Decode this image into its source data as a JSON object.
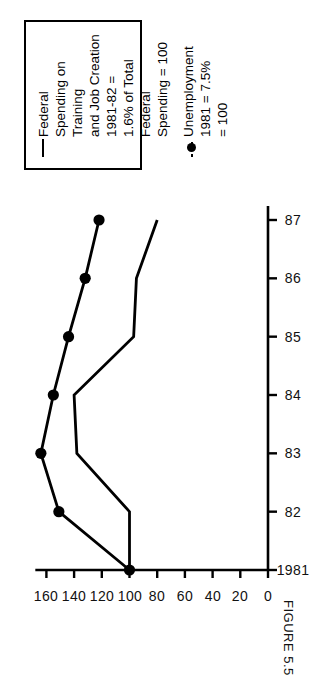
{
  "figure": {
    "caption": "FIGURE 5.5"
  },
  "legend": {
    "entries": [
      {
        "key": "solid-line",
        "label": "Federal Spending on Training\nand Job Creation  1981-82 =\n1.6% of Total Federal\nSpending = 100"
      },
      {
        "key": "dot-marker-line",
        "label": "Unemployment 1981 = 7.5%\n= 100"
      }
    ]
  },
  "chart_data": {
    "type": "line",
    "title": "",
    "subtitle": "",
    "xlabel": "",
    "ylabel": "",
    "x": [
      "1981",
      "82",
      "83",
      "84",
      "85",
      "86",
      "87"
    ],
    "xtick_labels": [
      "1981",
      "82",
      "83",
      "84",
      "85",
      "86",
      "87"
    ],
    "ytick_labels": [
      "0",
      "20",
      "40",
      "60",
      "80",
      "100",
      "120",
      "140",
      "160"
    ],
    "ytick_values": [
      0,
      20,
      40,
      60,
      80,
      100,
      120,
      140,
      160
    ],
    "ylim": [
      0,
      172
    ],
    "grid": false,
    "legend_position": "right",
    "series": [
      {
        "name": "Federal Spending on Training and Job Creation",
        "style": "solid",
        "markers": false,
        "values": [
          100,
          100,
          138,
          140,
          97,
          95,
          80
        ]
      },
      {
        "name": "Unemployment",
        "style": "solid-with-dots",
        "markers": true,
        "values": [
          100,
          151,
          164,
          155,
          144,
          132,
          122
        ]
      }
    ]
  }
}
